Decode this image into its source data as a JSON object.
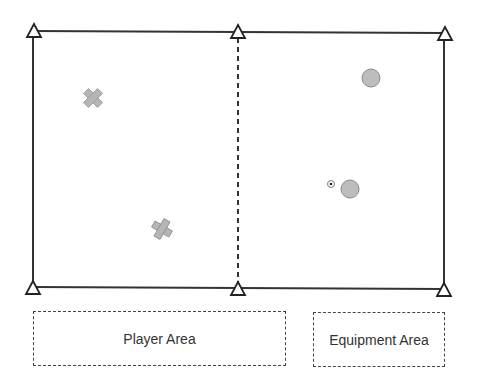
{
  "diagram": {
    "field": {
      "left_half": "Player zone",
      "right_half": "Equipment zone",
      "divider": "dashed"
    },
    "markers": {
      "cones": 6,
      "players": 2,
      "discs": 2,
      "ball": 1
    },
    "legend": {
      "player_area_label": "Player Area",
      "equipment_area_label": "Equipment Area"
    },
    "colors": {
      "line": "#333333",
      "marker_fill": "#b5b5b5",
      "marker_stroke": "#8a8a8a"
    }
  }
}
